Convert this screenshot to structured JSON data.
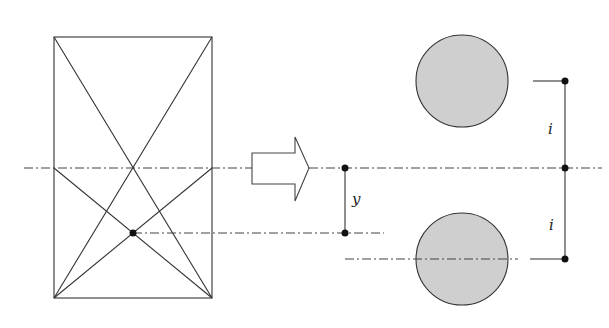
{
  "diagram": {
    "labels": {
      "y": "y",
      "i_top": "i",
      "i_bottom": "i"
    },
    "colors": {
      "line": "#333333",
      "circle_fill": "#cfcfcf",
      "dot": "#111111",
      "background": "#ffffff"
    },
    "elements": {
      "rectangle": {
        "x": 54,
        "y": 37,
        "w": 158,
        "h": 261
      },
      "centroid_dot": {
        "x": 133,
        "y": 233
      },
      "transform_arrow": {
        "direction": "right"
      },
      "circles": [
        {
          "cx": 462,
          "cy": 81,
          "r": 46
        },
        {
          "cx": 462,
          "cy": 259,
          "r": 46
        }
      ]
    }
  }
}
